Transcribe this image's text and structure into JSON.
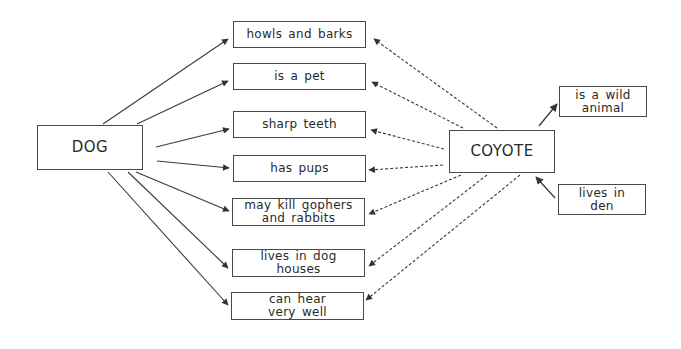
{
  "diagram": {
    "type": "double-bubble comparison map",
    "subjects": [
      {
        "id": "dog",
        "label": "DOG"
      },
      {
        "id": "coyote",
        "label": "COYOTE"
      }
    ],
    "shared_traits": [
      {
        "id": "howls",
        "label": "howls and barks",
        "from": [
          "dog",
          "coyote"
        ]
      },
      {
        "id": "pet",
        "label": "is a pet",
        "from": [
          "dog",
          "coyote"
        ]
      },
      {
        "id": "teeth",
        "label": "sharp teeth",
        "from": [
          "dog",
          "coyote"
        ]
      },
      {
        "id": "pups",
        "label": "has pups",
        "from": [
          "dog",
          "coyote"
        ]
      },
      {
        "id": "gophers",
        "label": "may kill gophers\nand rabbits",
        "from": [
          "dog",
          "coyote"
        ]
      },
      {
        "id": "doghouses",
        "label": "lives in dog\nhouses",
        "from": [
          "dog",
          "coyote"
        ]
      },
      {
        "id": "hear",
        "label": "can hear\nvery well",
        "from": [
          "dog",
          "coyote"
        ]
      }
    ],
    "coyote_only_traits": [
      {
        "id": "wild",
        "label": "is a wild\nanimal"
      },
      {
        "id": "den",
        "label": "lives in\nden"
      }
    ],
    "edge_styles": {
      "dog": "solid",
      "coyote": "dashed",
      "wild": "solid, from coyote to trait",
      "den": "solid, from trait to coyote"
    },
    "colors": {
      "line": "#3a3a3a",
      "text": "#2a2a2a",
      "background": "#ffffff"
    }
  }
}
